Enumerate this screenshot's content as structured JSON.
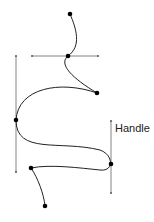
{
  "diagram": {
    "label": "Handle",
    "colors": {
      "curve": "#222222",
      "handle": "#555555",
      "anchor": "#000000",
      "text": "#222222"
    }
  }
}
